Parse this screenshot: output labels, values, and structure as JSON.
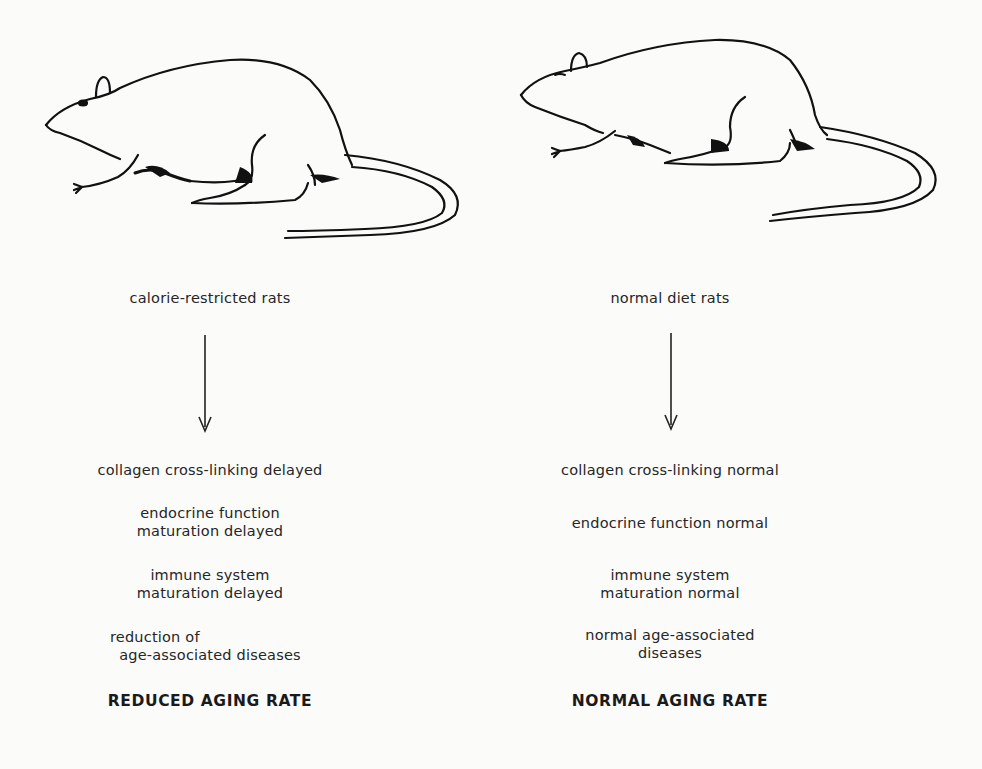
{
  "figure": {
    "left_column": {
      "image_label": "rat-illustration",
      "group_label": "calorie-restricted rats",
      "effects": [
        {
          "lines": [
            "collagen cross-linking delayed"
          ]
        },
        {
          "lines": [
            "endocrine function",
            "maturation delayed"
          ]
        },
        {
          "lines": [
            "immune system",
            "maturation delayed"
          ]
        },
        {
          "lines": [
            "reduction of",
            "age-associated diseases"
          ]
        }
      ],
      "outcome": "REDUCED AGING RATE"
    },
    "right_column": {
      "image_label": "rat-illustration",
      "group_label": "normal diet rats",
      "effects": [
        {
          "lines": [
            "collagen cross-linking normal"
          ]
        },
        {
          "lines": [
            "endocrine function normal"
          ]
        },
        {
          "lines": [
            "immune system",
            "maturation normal"
          ]
        },
        {
          "lines": [
            "normal age-associated",
            "diseases"
          ]
        }
      ],
      "outcome": "NORMAL AGING RATE"
    },
    "colors": {
      "background": "#fbfbfa",
      "ink": "#1a1a1a"
    }
  }
}
